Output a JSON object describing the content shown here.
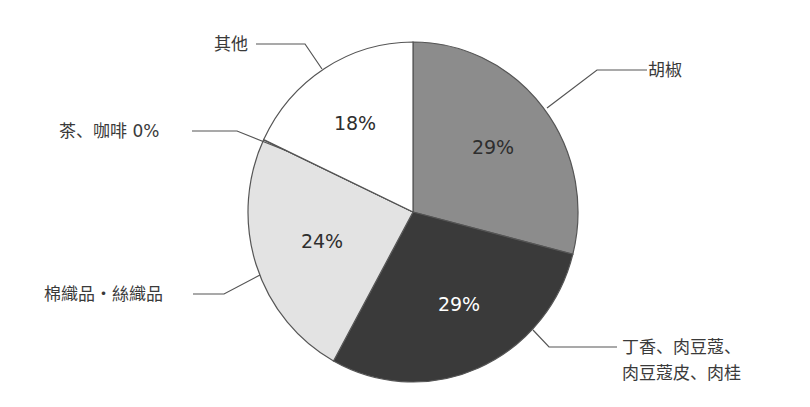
{
  "chart_data": {
    "type": "pie",
    "title": "",
    "start_angle_deg": 0,
    "direction": "clockwise",
    "slices": [
      {
        "label": "胡椒",
        "value": 29,
        "value_label": "29%",
        "color": "#8c8c8c",
        "text_color": "#2e2e2e"
      },
      {
        "label": "丁香、肉豆蔻、肉豆蔻皮、肉桂",
        "value": 29,
        "value_label": "29%",
        "color": "#3a3a3a",
        "text_color": "#ffffff"
      },
      {
        "label": "棉織品・絲織品",
        "value": 24,
        "value_label": "24%",
        "color": "#e3e3e3",
        "text_color": "#2e2e2e"
      },
      {
        "label": "茶、咖啡",
        "value": 0,
        "value_label": "0%",
        "color": "#ffffff",
        "text_color": "#2e2e2e"
      },
      {
        "label": "其他",
        "value": 18,
        "value_label": "18%",
        "color": "#ffffff",
        "text_color": "#2e2e2e"
      }
    ],
    "legend": "callout labels with leader lines"
  },
  "labels": {
    "pepper": "胡椒",
    "spices_line1": "丁香、肉豆蔻、",
    "spices_line2": "肉豆蔻皮、肉桂",
    "textiles": "棉織品・絲織品",
    "tea_coffee": "茶、咖啡 0%",
    "other": "其他"
  },
  "percents": {
    "pepper": "29%",
    "spices": "29%",
    "textiles": "24%",
    "other": "18%"
  }
}
